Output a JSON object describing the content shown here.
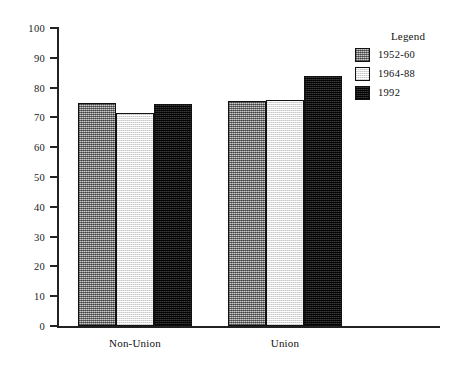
{
  "chart_data": {
    "type": "bar",
    "title": "",
    "subtitle": "",
    "xlabel": "",
    "ylabel": "",
    "categories": [
      "Non-Union",
      "Union"
    ],
    "series": [
      {
        "name": "1952-60",
        "values": [
          75,
          75.5
        ],
        "swatch": "#9a9a9a"
      },
      {
        "name": "1964-88",
        "values": [
          71.5,
          76
        ],
        "swatch": "#f4f4f4"
      },
      {
        "name": "1992",
        "values": [
          74.5,
          84
        ],
        "swatch": "#151515"
      }
    ],
    "ylim": [
      0,
      100
    ],
    "ytick_values": [
      0,
      10,
      20,
      30,
      40,
      50,
      60,
      70,
      80,
      90,
      100
    ],
    "ytick_labels": [
      "0",
      "10",
      "20",
      "30",
      "40",
      "50",
      "60",
      "70",
      "80",
      "90",
      "100"
    ],
    "grid": false,
    "legend": {
      "title": "Legend",
      "position": "top-right"
    },
    "bar_group_gap": true,
    "bars_adjacent_within_group": true
  }
}
